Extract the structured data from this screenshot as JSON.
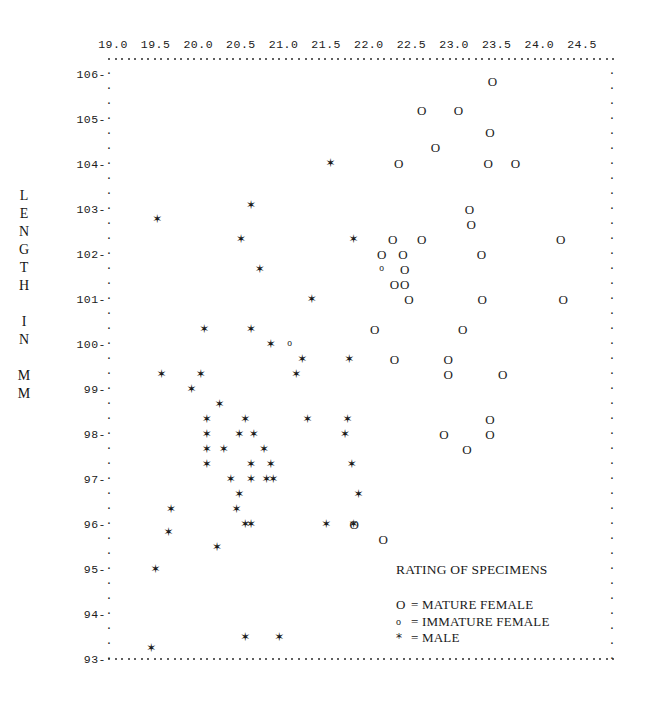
{
  "axis": {
    "y_title_chars": [
      "L",
      "E",
      "N",
      "G",
      "T",
      "H",
      "",
      "I",
      "N",
      "",
      "M",
      "M"
    ],
    "y_title_text": "LENGTH IN MM",
    "x_ticks": [
      "19.0",
      "19.5",
      "20.0",
      "20.5",
      "21.0",
      "21.5",
      "22.0",
      "22.5",
      "23.0",
      "23.5",
      "24.0",
      "24.5"
    ],
    "y_ticks": [
      "106",
      "105",
      "104",
      "103",
      "102",
      "101",
      "100",
      "99",
      "98",
      "97",
      "96",
      "95",
      "94",
      "93"
    ]
  },
  "legend": {
    "title": "RATING OF SPECIMENS",
    "entries": [
      {
        "symbol": "O",
        "text": "= MATURE FEMALE",
        "kind": "mature"
      },
      {
        "symbol": "o",
        "text": "= IMMATURE FEMALE",
        "kind": "immature"
      },
      {
        "symbol": "*",
        "text": "= MALE",
        "kind": "male"
      }
    ]
  },
  "chart_data": {
    "type": "scatter",
    "title": "RATING OF SPECIMENS",
    "xlabel": "",
    "ylabel": "LENGTH IN MM",
    "xlim": [
      18.85,
      24.75
    ],
    "ylim": [
      92.9,
      106.5
    ],
    "grid": false,
    "legend_position": "inside-bottom-right",
    "marker_glyphs": {
      "mature": "O",
      "immature": "o",
      "male": "*"
    },
    "series": [
      {
        "name": "MATURE FEMALE",
        "symbol": "O",
        "points": [
          [
            23.45,
            105.85
          ],
          [
            22.62,
            105.2
          ],
          [
            23.05,
            105.2
          ],
          [
            23.42,
            104.72
          ],
          [
            22.78,
            104.37
          ],
          [
            22.35,
            104.03
          ],
          [
            23.4,
            104.03
          ],
          [
            23.72,
            104.03
          ],
          [
            23.18,
            103.0
          ],
          [
            23.2,
            102.67
          ],
          [
            22.28,
            102.33
          ],
          [
            22.62,
            102.33
          ],
          [
            24.25,
            102.33
          ],
          [
            22.15,
            102.0
          ],
          [
            22.4,
            102.0
          ],
          [
            23.32,
            102.0
          ],
          [
            22.42,
            101.67
          ],
          [
            22.3,
            101.33
          ],
          [
            22.42,
            101.33
          ],
          [
            22.47,
            101.0
          ],
          [
            23.33,
            101.0
          ],
          [
            24.28,
            101.0
          ],
          [
            22.07,
            100.33
          ],
          [
            23.1,
            100.33
          ],
          [
            22.3,
            99.67
          ],
          [
            22.93,
            99.67
          ],
          [
            22.93,
            99.33
          ],
          [
            23.57,
            99.33
          ],
          [
            23.42,
            98.33
          ],
          [
            22.88,
            98.0
          ],
          [
            23.42,
            98.0
          ],
          [
            23.15,
            97.67
          ],
          [
            22.17,
            95.67
          ],
          [
            21.83,
            96.0
          ]
        ]
      },
      {
        "name": "IMMATURE FEMALE",
        "symbol": "o",
        "points": [
          [
            22.15,
            101.67
          ],
          [
            21.07,
            100.0
          ]
        ]
      },
      {
        "name": "MALE",
        "symbol": "*",
        "points": [
          [
            21.55,
            104.03
          ],
          [
            20.62,
            103.1
          ],
          [
            19.52,
            102.78
          ],
          [
            20.5,
            102.33
          ],
          [
            21.82,
            102.33
          ],
          [
            20.72,
            101.67
          ],
          [
            21.33,
            101.0
          ],
          [
            20.07,
            100.33
          ],
          [
            20.62,
            100.33
          ],
          [
            20.85,
            100.0
          ],
          [
            21.22,
            99.67
          ],
          [
            21.77,
            99.67
          ],
          [
            19.57,
            99.33
          ],
          [
            20.03,
            99.33
          ],
          [
            21.15,
            99.33
          ],
          [
            19.92,
            99.0
          ],
          [
            20.25,
            98.67
          ],
          [
            20.1,
            98.33
          ],
          [
            20.55,
            98.33
          ],
          [
            21.28,
            98.33
          ],
          [
            21.75,
            98.33
          ],
          [
            20.1,
            98.0
          ],
          [
            20.48,
            98.0
          ],
          [
            20.65,
            98.0
          ],
          [
            21.72,
            98.0
          ],
          [
            20.1,
            97.67
          ],
          [
            20.3,
            97.67
          ],
          [
            20.77,
            97.67
          ],
          [
            20.1,
            97.33
          ],
          [
            20.62,
            97.33
          ],
          [
            20.85,
            97.33
          ],
          [
            21.8,
            97.33
          ],
          [
            20.38,
            97.0
          ],
          [
            20.62,
            97.0
          ],
          [
            20.8,
            97.0
          ],
          [
            20.88,
            97.0
          ],
          [
            20.48,
            96.67
          ],
          [
            21.88,
            96.67
          ],
          [
            19.68,
            96.33
          ],
          [
            20.45,
            96.33
          ],
          [
            20.55,
            96.0
          ],
          [
            20.62,
            96.0
          ],
          [
            21.5,
            96.0
          ],
          [
            21.82,
            96.0
          ],
          [
            19.65,
            95.83
          ],
          [
            20.22,
            95.5
          ],
          [
            19.5,
            95.0
          ],
          [
            20.55,
            93.5
          ],
          [
            20.95,
            93.5
          ],
          [
            19.45,
            93.25
          ]
        ]
      }
    ]
  }
}
